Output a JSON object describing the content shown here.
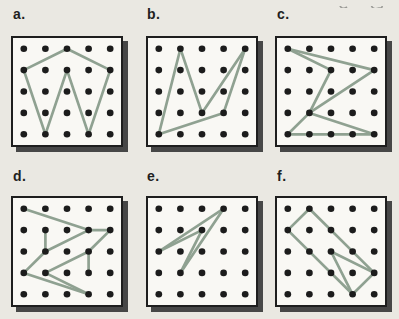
{
  "figure": {
    "title_note": "",
    "grid": {
      "rows": 5,
      "cols": 5
    },
    "panels": [
      {
        "label": "a.",
        "segments": [
          [
            [
              0,
              1
            ],
            [
              2,
              0
            ]
          ],
          [
            [
              2,
              0
            ],
            [
              4,
              1
            ]
          ],
          [
            [
              4,
              1
            ],
            [
              3,
              4
            ]
          ],
          [
            [
              3,
              4
            ],
            [
              2,
              1
            ]
          ],
          [
            [
              2,
              1
            ],
            [
              1,
              4
            ]
          ],
          [
            [
              1,
              4
            ],
            [
              0,
              1
            ]
          ]
        ]
      },
      {
        "label": "b.",
        "segments": [
          [
            [
              0,
              4
            ],
            [
              1,
              0
            ]
          ],
          [
            [
              1,
              0
            ],
            [
              2,
              3
            ]
          ],
          [
            [
              2,
              3
            ],
            [
              4,
              0
            ]
          ],
          [
            [
              4,
              0
            ],
            [
              3,
              3
            ]
          ],
          [
            [
              3,
              3
            ],
            [
              0,
              4
            ]
          ]
        ]
      },
      {
        "label": "c.",
        "segments": [
          [
            [
              2,
              1
            ],
            [
              0,
              0
            ]
          ],
          [
            [
              0,
              0
            ],
            [
              4,
              1
            ]
          ],
          [
            [
              4,
              1
            ],
            [
              1,
              3
            ]
          ],
          [
            [
              1,
              3
            ],
            [
              2,
              1
            ]
          ],
          [
            [
              1,
              3
            ],
            [
              0,
              4
            ]
          ],
          [
            [
              1,
              3
            ],
            [
              4,
              4
            ]
          ],
          [
            [
              0,
              4
            ],
            [
              4,
              4
            ]
          ]
        ]
      },
      {
        "label": "d.",
        "segments": [
          [
            [
              0,
              0
            ],
            [
              3,
              1
            ]
          ],
          [
            [
              3,
              1
            ],
            [
              4,
              1
            ]
          ],
          [
            [
              4,
              1
            ],
            [
              3,
              2
            ]
          ],
          [
            [
              3,
              2
            ],
            [
              3,
              3
            ]
          ],
          [
            [
              3,
              2
            ],
            [
              1,
              3
            ]
          ],
          [
            [
              1,
              3
            ],
            [
              3,
              4
            ]
          ],
          [
            [
              0,
              3
            ],
            [
              3,
              4
            ]
          ],
          [
            [
              0,
              3
            ],
            [
              1,
              2
            ]
          ],
          [
            [
              1,
              2
            ],
            [
              3,
              1
            ]
          ],
          [
            [
              1,
              1
            ],
            [
              1,
              2
            ]
          ]
        ]
      },
      {
        "label": "e.",
        "segments": [
          [
            [
              0,
              2
            ],
            [
              3,
              0
            ]
          ],
          [
            [
              3,
              0
            ],
            [
              1,
              3
            ]
          ],
          [
            [
              1,
              3
            ],
            [
              2,
              1
            ]
          ],
          [
            [
              2,
              1
            ],
            [
              0,
              2
            ]
          ]
        ]
      },
      {
        "label": "f.",
        "segments": [
          [
            [
              1,
              0
            ],
            [
              0,
              1
            ]
          ],
          [
            [
              0,
              1
            ],
            [
              3,
              4
            ]
          ],
          [
            [
              1,
              0
            ],
            [
              4,
              3
            ]
          ],
          [
            [
              2,
              2
            ],
            [
              4,
              3
            ]
          ],
          [
            [
              2,
              2
            ],
            [
              3,
              4
            ]
          ],
          [
            [
              4,
              3
            ],
            [
              3,
              4
            ]
          ]
        ]
      }
    ]
  },
  "colors": {
    "page_background": "#eae8e2",
    "board_fill": "#f9f8f4",
    "board_border": "#1e1e1e",
    "board_shadow": "#474747",
    "peg": "#1c1c1c",
    "band": "#8fa191",
    "artifact": "#9a9a96"
  },
  "layout": {
    "labels": [
      {
        "x": 13,
        "y": 6
      },
      {
        "x": 147,
        "y": 6
      },
      {
        "x": 277,
        "y": 6
      },
      {
        "x": 13,
        "y": 168
      },
      {
        "x": 147,
        "y": 168
      },
      {
        "x": 277,
        "y": 168
      }
    ],
    "boards": [
      {
        "x": 11,
        "y": 36
      },
      {
        "x": 146,
        "y": 36
      },
      {
        "x": 275,
        "y": 36
      },
      {
        "x": 11,
        "y": 196
      },
      {
        "x": 146,
        "y": 196
      },
      {
        "x": 275,
        "y": 196
      }
    ]
  }
}
